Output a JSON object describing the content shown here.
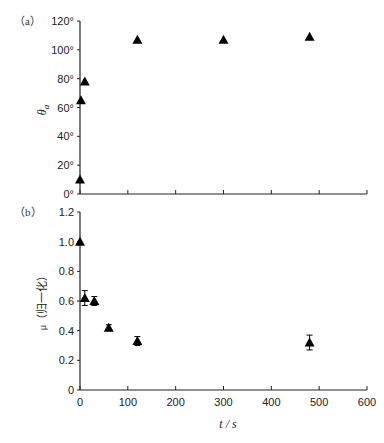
{
  "chart_data": [
    {
      "panel": "(a)",
      "type": "scatter",
      "xlabel": "",
      "ylabel": "θa",
      "ylim": [
        0,
        120
      ],
      "xlim": [
        0,
        600
      ],
      "yticks": [
        "0°",
        "20°",
        "40°",
        "60°",
        "80°",
        "100°",
        "120°"
      ],
      "xticks": [
        0,
        100,
        200,
        300,
        400,
        500,
        600
      ],
      "grid": false,
      "marker": "triangle",
      "series": [
        {
          "name": "θa",
          "x": [
            0,
            2,
            10,
            120,
            300,
            480
          ],
          "y": [
            10,
            65,
            78,
            107,
            107,
            109
          ]
        }
      ]
    },
    {
      "panel": "(b)",
      "type": "scatter",
      "xlabel": "t / s",
      "ylabel": "μ（归一化）",
      "ylim": [
        0,
        1.2
      ],
      "xlim": [
        0,
        600
      ],
      "yticks": [
        "0",
        "0.2",
        "0.4",
        "0.6",
        "0.8",
        "1.0",
        "1.2"
      ],
      "xticks": [
        "0",
        "100",
        "200",
        "300",
        "400",
        "500",
        "600"
      ],
      "grid": false,
      "marker": "triangle",
      "series": [
        {
          "name": "μ",
          "x": [
            0,
            10,
            30,
            60,
            120,
            480
          ],
          "y": [
            1.0,
            0.62,
            0.6,
            0.42,
            0.33,
            0.32
          ],
          "error": [
            0,
            0.05,
            0.03,
            0.02,
            0.03,
            0.05
          ]
        }
      ]
    }
  ],
  "labels": {
    "panel_a": "（a）",
    "panel_b": "（b）",
    "ylabel_a_main": "θ",
    "ylabel_a_sub": "a",
    "ylabel_b": "μ（归一化）",
    "xlabel": "t / s"
  }
}
